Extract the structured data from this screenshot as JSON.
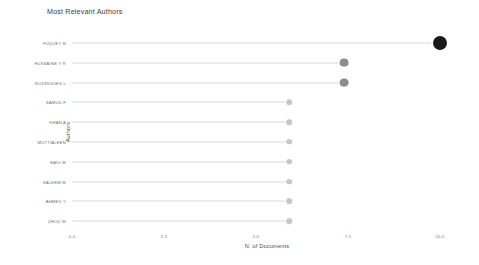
{
  "chart_data": {
    "type": "scatter",
    "title": "Most Relevant Authors",
    "xlabel": "N. of Documents",
    "ylabel": "Authors",
    "xlim": [
      0,
      10.6
    ],
    "xticks": [
      "0.0",
      "2.5",
      "5.0",
      "7.5",
      "10.0"
    ],
    "xtick_values": [
      0.0,
      2.5,
      5.0,
      7.5,
      10.0
    ],
    "grid": false,
    "legend": "none",
    "orientation": "horizontal",
    "marker_shape": "circle",
    "categories": [
      "FUQUEY H",
      "HUSSAINE Y R",
      "RODRIGUES L",
      "SAMUD F",
      "KHAN A",
      "MUTTIALEEN",
      "BAIG M",
      "SALEEM M",
      "AHMED Y",
      "ZHOU W"
    ],
    "values": [
      10,
      7.4,
      7.4,
      5.9,
      5.9,
      5.9,
      5.9,
      5.9,
      5.9,
      5.9
    ],
    "points": [
      {
        "label": "FUQUEY H",
        "value": 10,
        "marker_size": 9.0,
        "color": "#1a1a1a"
      },
      {
        "label": "HUSSAINE Y R",
        "value": 7.4,
        "marker_size": 5.4,
        "color": "#8c8c8c"
      },
      {
        "label": "RODRIGUES L",
        "value": 7.4,
        "marker_size": 5.4,
        "color": "#8c8c8c"
      },
      {
        "label": "SAMUD F",
        "value": 5.9,
        "marker_size": 3.8,
        "color": "#c6c6c6"
      },
      {
        "label": "KHAN A",
        "value": 5.9,
        "marker_size": 3.8,
        "color": "#c6c6c6"
      },
      {
        "label": "MUTTIALEEN",
        "value": 5.9,
        "marker_size": 3.8,
        "color": "#c6c6c6"
      },
      {
        "label": "BAIG M",
        "value": 5.9,
        "marker_size": 3.8,
        "color": "#c6c6c6"
      },
      {
        "label": "SALEEM M",
        "value": 5.9,
        "marker_size": 3.8,
        "color": "#c6c6c6"
      },
      {
        "label": "AHMED Y",
        "value": 5.9,
        "marker_size": 3.8,
        "color": "#c6c6c6"
      },
      {
        "label": "ZHOU W",
        "value": 5.9,
        "marker_size": 3.8,
        "color": "#c6c6c6"
      }
    ],
    "stem_color": "#d8d8d8",
    "background": "#ffffff"
  }
}
